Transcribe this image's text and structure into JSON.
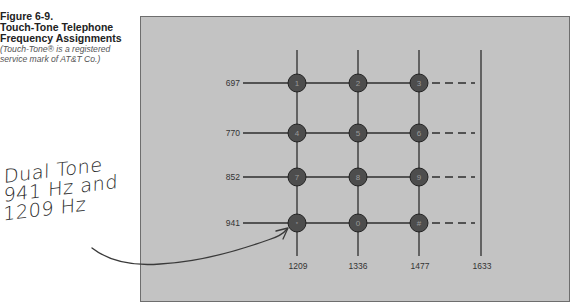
{
  "caption": {
    "figure_number": "Figure 6-9.",
    "title_line1": "Touch-Tone Telephone",
    "title_line2": "Frequency Assignments",
    "note_line1": "(Touch-Tone® is a registered",
    "note_line2": "service mark of AT&T Co.)"
  },
  "annotation": {
    "line1": "Dual Tone",
    "line2": "941 Hz and",
    "line3": "1209 Hz"
  },
  "grid": {
    "row_frequencies_hz": [
      "697",
      "770",
      "852",
      "941"
    ],
    "column_frequencies_hz": [
      "1209",
      "1336",
      "1477",
      "1633"
    ],
    "keys": [
      [
        "1",
        "2",
        "3"
      ],
      [
        "4",
        "5",
        "6"
      ],
      [
        "7",
        "8",
        "9"
      ],
      [
        "*",
        "0",
        "#"
      ]
    ],
    "highlighted_key": "*"
  },
  "colors": {
    "panel_background": "#c3c3c3",
    "panel_border": "#6e6e6e",
    "line": "#2e2e2e",
    "key_fill": "#4d4d4d",
    "key_text": "#9a9a9a"
  }
}
